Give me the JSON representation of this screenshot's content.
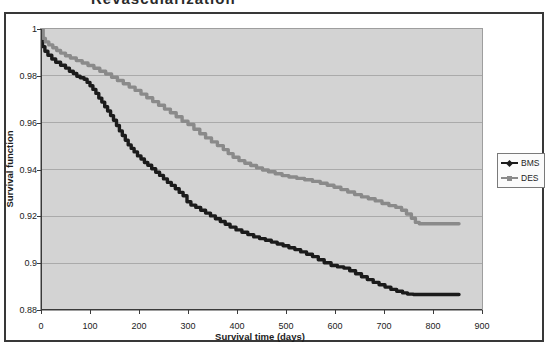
{
  "chart_data": {
    "type": "line",
    "title": "Revascularization",
    "xlabel": "Survival time (days)",
    "ylabel": "Survival function",
    "xlim": [
      0,
      900
    ],
    "ylim": [
      0.88,
      1
    ],
    "xticks": [
      0,
      100,
      200,
      300,
      400,
      500,
      600,
      700,
      800,
      900
    ],
    "yticks": [
      1,
      0.98,
      0.96,
      0.94,
      0.92,
      0.9,
      0.88
    ],
    "grid": "horizontal-only",
    "legend_position": "right",
    "step": true,
    "plot_bg": "#d3d3d3",
    "grid_color": "#aaaaaa",
    "axis_color": "#3a3a3a",
    "series": [
      {
        "name": "BMS",
        "marker": "diamond",
        "color": "#1b1b1b",
        "points": [
          [
            0,
            1.0
          ],
          [
            3,
            0.9925
          ],
          [
            8,
            0.9905
          ],
          [
            14,
            0.9888
          ],
          [
            22,
            0.9872
          ],
          [
            30,
            0.9858
          ],
          [
            40,
            0.9845
          ],
          [
            50,
            0.9833
          ],
          [
            58,
            0.982
          ],
          [
            66,
            0.981
          ],
          [
            73,
            0.9798
          ],
          [
            80,
            0.9792
          ],
          [
            88,
            0.9785
          ],
          [
            94,
            0.9772
          ],
          [
            100,
            0.9758
          ],
          [
            106,
            0.9742
          ],
          [
            112,
            0.9725
          ],
          [
            118,
            0.9705
          ],
          [
            124,
            0.9688
          ],
          [
            130,
            0.9668
          ],
          [
            136,
            0.965
          ],
          [
            142,
            0.963
          ],
          [
            148,
            0.961
          ],
          [
            154,
            0.9588
          ],
          [
            160,
            0.9565
          ],
          [
            166,
            0.9545
          ],
          [
            172,
            0.9525
          ],
          [
            178,
            0.9505
          ],
          [
            184,
            0.949
          ],
          [
            190,
            0.9475
          ],
          [
            197,
            0.9458
          ],
          [
            204,
            0.9445
          ],
          [
            211,
            0.943
          ],
          [
            218,
            0.9418
          ],
          [
            226,
            0.9403
          ],
          [
            234,
            0.9388
          ],
          [
            242,
            0.9375
          ],
          [
            250,
            0.936
          ],
          [
            258,
            0.9345
          ],
          [
            266,
            0.9332
          ],
          [
            274,
            0.9318
          ],
          [
            282,
            0.9302
          ],
          [
            290,
            0.9288
          ],
          [
            298,
            0.9262
          ],
          [
            306,
            0.9248
          ],
          [
            316,
            0.9238
          ],
          [
            326,
            0.9226
          ],
          [
            336,
            0.9214
          ],
          [
            346,
            0.9202
          ],
          [
            356,
            0.919
          ],
          [
            366,
            0.9178
          ],
          [
            376,
            0.9166
          ],
          [
            386,
            0.9154
          ],
          [
            398,
            0.9142
          ],
          [
            410,
            0.9132
          ],
          [
            422,
            0.9122
          ],
          [
            434,
            0.9112
          ],
          [
            446,
            0.9105
          ],
          [
            458,
            0.9098
          ],
          [
            470,
            0.909
          ],
          [
            482,
            0.9082
          ],
          [
            494,
            0.9074
          ],
          [
            506,
            0.9066
          ],
          [
            518,
            0.9058
          ],
          [
            530,
            0.9048
          ],
          [
            542,
            0.9038
          ],
          [
            554,
            0.9028
          ],
          [
            566,
            0.9015
          ],
          [
            578,
            0.9002
          ],
          [
            592,
            0.899
          ],
          [
            605,
            0.8984
          ],
          [
            618,
            0.8979
          ],
          [
            630,
            0.8968
          ],
          [
            642,
            0.8955
          ],
          [
            654,
            0.8942
          ],
          [
            666,
            0.893
          ],
          [
            678,
            0.8918
          ],
          [
            690,
            0.8908
          ],
          [
            702,
            0.8898
          ],
          [
            714,
            0.8888
          ],
          [
            726,
            0.888
          ],
          [
            738,
            0.8873
          ],
          [
            748,
            0.8868
          ],
          [
            760,
            0.8866
          ],
          [
            853,
            0.8866
          ]
        ]
      },
      {
        "name": "DES",
        "marker": "square",
        "color": "#8a8a8a",
        "points": [
          [
            0,
            1.0
          ],
          [
            4,
            0.996
          ],
          [
            9,
            0.9945
          ],
          [
            16,
            0.9932
          ],
          [
            24,
            0.992
          ],
          [
            32,
            0.9908
          ],
          [
            40,
            0.9897
          ],
          [
            50,
            0.9886
          ],
          [
            60,
            0.9876
          ],
          [
            72,
            0.9865
          ],
          [
            84,
            0.9855
          ],
          [
            96,
            0.9844
          ],
          [
            108,
            0.9832
          ],
          [
            120,
            0.982
          ],
          [
            132,
            0.9808
          ],
          [
            144,
            0.9794
          ],
          [
            156,
            0.978
          ],
          [
            168,
            0.9766
          ],
          [
            180,
            0.9752
          ],
          [
            192,
            0.9738
          ],
          [
            204,
            0.9722
          ],
          [
            216,
            0.9706
          ],
          [
            228,
            0.969
          ],
          [
            240,
            0.9674
          ],
          [
            252,
            0.9658
          ],
          [
            264,
            0.9642
          ],
          [
            276,
            0.9625
          ],
          [
            288,
            0.9606
          ],
          [
            300,
            0.9592
          ],
          [
            312,
            0.9572
          ],
          [
            324,
            0.9553
          ],
          [
            336,
            0.9535
          ],
          [
            348,
            0.9518
          ],
          [
            360,
            0.9502
          ],
          [
            372,
            0.9485
          ],
          [
            382,
            0.9468
          ],
          [
            392,
            0.9452
          ],
          [
            404,
            0.9438
          ],
          [
            416,
            0.9427
          ],
          [
            428,
            0.9417
          ],
          [
            440,
            0.9407
          ],
          [
            452,
            0.9398
          ],
          [
            464,
            0.939
          ],
          [
            478,
            0.9382
          ],
          [
            492,
            0.9374
          ],
          [
            506,
            0.9368
          ],
          [
            522,
            0.9362
          ],
          [
            538,
            0.9356
          ],
          [
            554,
            0.9349
          ],
          [
            570,
            0.9341
          ],
          [
            584,
            0.9333
          ],
          [
            598,
            0.9324
          ],
          [
            612,
            0.9314
          ],
          [
            626,
            0.9304
          ],
          [
            640,
            0.9293
          ],
          [
            654,
            0.9283
          ],
          [
            668,
            0.9275
          ],
          [
            682,
            0.9266
          ],
          [
            696,
            0.9255
          ],
          [
            710,
            0.9246
          ],
          [
            724,
            0.9238
          ],
          [
            736,
            0.9226
          ],
          [
            746,
            0.921
          ],
          [
            756,
            0.9192
          ],
          [
            764,
            0.9174
          ],
          [
            772,
            0.9168
          ],
          [
            853,
            0.9168
          ]
        ]
      }
    ]
  }
}
